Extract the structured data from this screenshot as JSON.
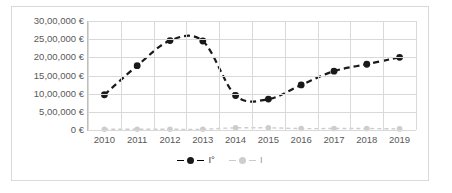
{
  "chart_data": {
    "type": "line",
    "title": "",
    "xlabel": "",
    "ylabel": "",
    "categories": [
      "2010",
      "2011",
      "2012",
      "2013",
      "2014",
      "2015",
      "2016",
      "2017",
      "2018",
      "2019"
    ],
    "ylim": [
      0,
      3000000
    ],
    "ytick_values": [
      0,
      500000,
      1000000,
      1500000,
      2000000,
      2500000,
      3000000
    ],
    "ytick_labels": [
      "0 €",
      "5,00,000 €",
      "10,00,000 €",
      "15,00,000 €",
      "20,00,000 €",
      "25,00,000 €",
      "30,00,000 €"
    ],
    "grid": true,
    "legend_position": "bottom",
    "smooth": true,
    "line_style": "dashed",
    "series": [
      {
        "name": "I°",
        "color": "#1a1a1a",
        "values": [
          970000,
          1770000,
          2460000,
          2450000,
          950000,
          850000,
          1240000,
          1620000,
          1810000,
          2000000
        ]
      },
      {
        "name": "I",
        "color": "#cdcdcd",
        "values": [
          20000,
          20000,
          20000,
          20000,
          60000,
          60000,
          40000,
          40000,
          40000,
          30000
        ]
      }
    ]
  },
  "legend": {
    "entries": [
      {
        "label": "I°"
      },
      {
        "label": "I"
      }
    ]
  },
  "colors": {
    "series_dark": "#1a1a1a",
    "series_light": "#cdcdcd",
    "gridline": "#d9d9d9",
    "axis": "#bfbfbf",
    "tick_text": "#595959",
    "frame": "#d9d9d9"
  }
}
